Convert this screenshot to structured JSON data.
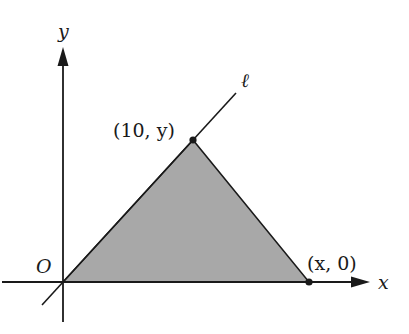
{
  "diagram": {
    "axes": {
      "x_label": "x",
      "y_label": "y",
      "origin_label": "O"
    },
    "line": {
      "label": "ℓ"
    },
    "points": [
      {
        "name": "apex",
        "label": "(10, y)"
      },
      {
        "name": "x-intercept",
        "label": "(x, 0)"
      }
    ],
    "shape": {
      "type": "triangle",
      "vertices": [
        "O",
        "(10, y)",
        "(x, 0)"
      ],
      "fill": "#a8a8a8"
    },
    "colors": {
      "stroke": "#1a1a1a",
      "fill": "#a8a8a8"
    }
  }
}
